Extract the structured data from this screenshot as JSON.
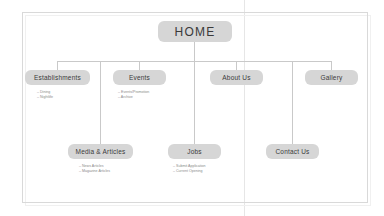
{
  "diagram": {
    "root": {
      "label": "HOME"
    },
    "colors": {
      "node_fill": "#d6d6d6",
      "connector": "#c9c9c9",
      "frame_border": "#d9d9d9",
      "node_text": "#3a3a3a",
      "sub_text": "#8a8a8a",
      "background": "#ffffff"
    },
    "level1": [
      {
        "label": "Establishments"
      },
      {
        "label": "Events"
      },
      {
        "label": "About Us"
      },
      {
        "label": "Gallery"
      }
    ],
    "level2": [
      {
        "label": "Media & Articles"
      },
      {
        "label": "Jobs"
      },
      {
        "label": "Contact Us"
      }
    ],
    "sublists": {
      "establishments": [
        {
          "bullet": "–",
          "label": "Dining"
        },
        {
          "bullet": "–",
          "label": "Nightlife"
        }
      ],
      "events": [
        {
          "bullet": "–",
          "label": "Events/Promotion"
        },
        {
          "bullet": "–",
          "label": "Archive"
        }
      ],
      "media_articles": [
        {
          "bullet": "–",
          "label": "News Articles"
        },
        {
          "bullet": "–",
          "label": "Magazine Articles"
        }
      ],
      "jobs": [
        {
          "bullet": "–",
          "label": "Submit Application"
        },
        {
          "bullet": "–",
          "label": "Current Opening"
        }
      ]
    }
  }
}
